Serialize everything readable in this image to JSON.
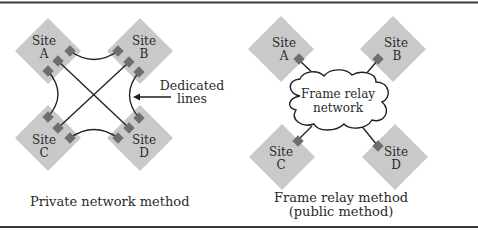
{
  "colors": {
    "border": "#3a3a3a",
    "site_fill": "#c9c9c9",
    "connector_fill": "#6e6e6e",
    "line": "#1e1e1e",
    "cloud_fill": "#ffffff"
  },
  "private": {
    "caption": "Private network method",
    "annotation": {
      "line1": "Dedicated",
      "line2": "lines"
    },
    "sites": [
      {
        "word": "Site",
        "letter": "A"
      },
      {
        "word": "Site",
        "letter": "B"
      },
      {
        "word": "Site",
        "letter": "C"
      },
      {
        "word": "Site",
        "letter": "D"
      }
    ]
  },
  "frame_relay": {
    "caption_line1": "Frame relay method",
    "caption_line2": "(public method)",
    "cloud": {
      "line1": "Frame relay",
      "line2": "network"
    },
    "sites": [
      {
        "word": "Site",
        "letter": "A"
      },
      {
        "word": "Site",
        "letter": "B"
      },
      {
        "word": "Site",
        "letter": "C"
      },
      {
        "word": "Site",
        "letter": "D"
      }
    ]
  }
}
